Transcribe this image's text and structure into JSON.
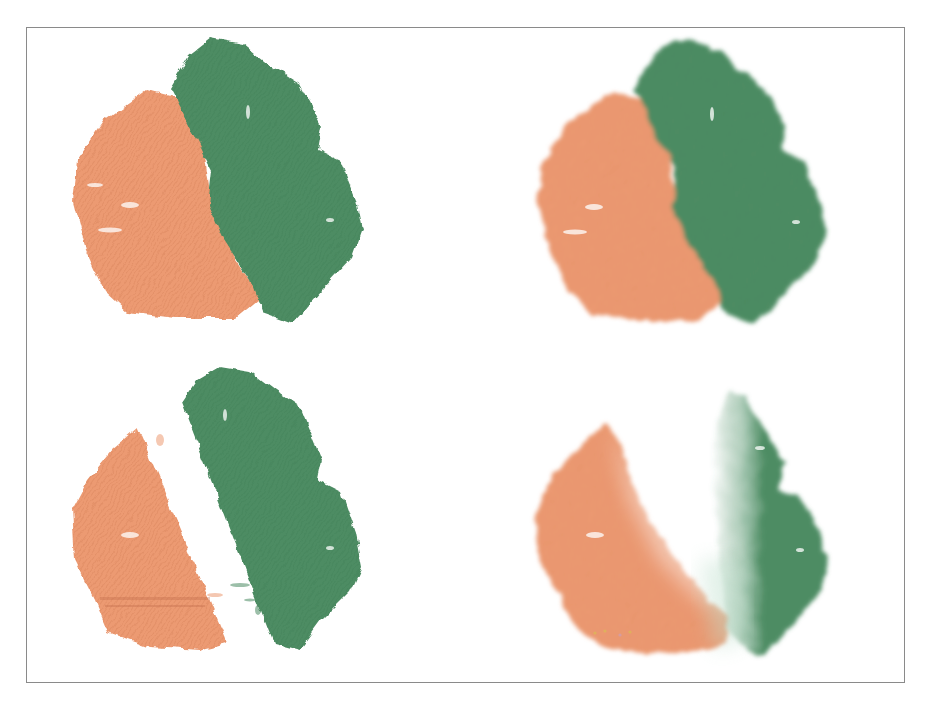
{
  "illustration": {
    "subject": "paint blending technique samples",
    "panels": [
      {
        "id": "top-left",
        "technique": "colors overlapping, hard edge"
      },
      {
        "id": "top-right",
        "technique": "colors overlapping, softened edge"
      },
      {
        "id": "bottom-left",
        "technique": "colors separated by white gap"
      },
      {
        "id": "bottom-right",
        "technique": "colors blended softly into white"
      }
    ]
  },
  "colors": {
    "orange": "#ec9a72",
    "orange_dark": "#e08a60",
    "green": "#4d8c63",
    "green_dark": "#3f7d55",
    "frame_border": "#8a8a8a",
    "background": "#ffffff"
  }
}
